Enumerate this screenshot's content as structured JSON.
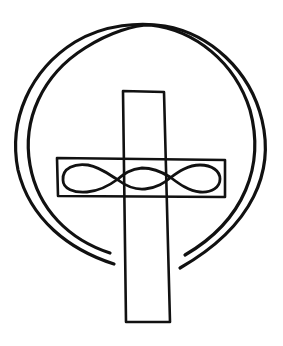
{
  "figure": {
    "description": "Hand-drawn cross with double circular halo and interlaced loop band",
    "colors": {
      "ink": "#111111",
      "background": "#ffffff"
    }
  }
}
